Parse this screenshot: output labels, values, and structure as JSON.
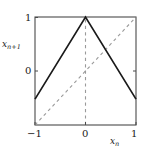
{
  "figure": {
    "background_color": "#ffffff",
    "frame_color": "#404040",
    "curve_color": "#1a1a1a",
    "dashed_color": "#9a9a9a"
  },
  "axes": {
    "ylabel_main": "x",
    "ylabel_sub": "n+1",
    "xlabel_main": "x",
    "xlabel_sub": "n",
    "yticks": [
      "1",
      "0"
    ],
    "xticks": [
      "−1",
      "0",
      "1"
    ]
  },
  "chart_data": {
    "type": "line",
    "title": "",
    "xlabel": "x_n",
    "ylabel": "x_{n+1}",
    "xlim": [
      -1,
      1
    ],
    "ylim": [
      -1,
      1
    ],
    "xticks": [
      -1,
      0,
      1
    ],
    "xtick_labels": [
      "−1",
      "0",
      "1"
    ],
    "yticks": [
      0,
      1
    ],
    "ytick_labels": [
      "0",
      "1"
    ],
    "grid": false,
    "legend": null,
    "series": [
      {
        "name": "tent map",
        "style": "solid",
        "color": "#1a1a1a",
        "x": [
          -1,
          0,
          1
        ],
        "y": [
          -0.52,
          1,
          -0.52
        ]
      },
      {
        "name": "identity line y = x",
        "style": "dashed",
        "color": "#9a9a9a",
        "x": [
          -1,
          1
        ],
        "y": [
          -1,
          1
        ]
      },
      {
        "name": "vertical marker at x = 0",
        "style": "dashed",
        "color": "#9a9a9a",
        "x": [
          0,
          0
        ],
        "y": [
          -1,
          1
        ]
      }
    ]
  }
}
